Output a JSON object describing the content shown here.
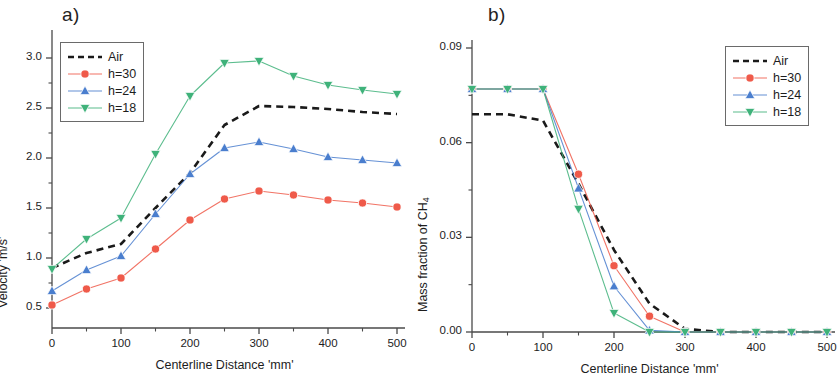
{
  "figure": {
    "panels": [
      {
        "id": "a",
        "label": "a)",
        "legend": {
          "position": "top-left",
          "entries": [
            {
              "name": "Air",
              "marker": "none",
              "color": "#1a1a1a",
              "dash": true
            },
            {
              "name": "h=30",
              "marker": "circle",
              "color": "#ef5a4a",
              "dash": false
            },
            {
              "name": "h=24",
              "marker": "triangle-up",
              "color": "#4a7ece",
              "dash": false
            },
            {
              "name": "h=18",
              "marker": "triangle-down",
              "color": "#3fb27a",
              "dash": false
            }
          ]
        },
        "chart_data": {
          "type": "line",
          "title": "",
          "xlabel": "Centerline Distance 'mm'",
          "ylabel": "Velocity 'm/s'",
          "xlim": [
            0,
            500
          ],
          "ylim": [
            0.3,
            3.2
          ],
          "xticks": [
            0,
            100,
            200,
            300,
            400,
            500
          ],
          "xtick_labels": [
            "0",
            "100",
            "200",
            "300",
            "400",
            "500"
          ],
          "yticks": [
            0.5,
            1.0,
            1.5,
            2.0,
            2.5,
            3.0
          ],
          "ytick_labels": [
            "0.5",
            "1.0",
            "1.5",
            "2.0",
            "2.5",
            "3.0"
          ],
          "minor_ticks": true,
          "grid": false,
          "legend_position": "top-left",
          "x": [
            0,
            50,
            100,
            150,
            200,
            250,
            300,
            350,
            400,
            450,
            500
          ],
          "series": [
            {
              "name": "Air",
              "color": "#1a1a1a",
              "style": "dashed",
              "marker": "none",
              "values": [
                0.9,
                1.05,
                1.14,
                1.5,
                1.85,
                2.33,
                2.52,
                2.51,
                2.49,
                2.46,
                2.44
              ]
            },
            {
              "name": "h=30",
              "color": "#ef5a4a",
              "style": "solid",
              "marker": "circle",
              "values": [
                0.53,
                0.69,
                0.8,
                1.09,
                1.38,
                1.59,
                1.67,
                1.63,
                1.58,
                1.55,
                1.51
              ]
            },
            {
              "name": "h=24",
              "color": "#4a7ece",
              "style": "solid",
              "marker": "triangle-up",
              "values": [
                0.67,
                0.88,
                1.02,
                1.44,
                1.84,
                2.1,
                2.16,
                2.09,
                2.01,
                1.98,
                1.95
              ]
            },
            {
              "name": "h=18",
              "color": "#3fb27a",
              "style": "solid",
              "marker": "triangle-down",
              "values": [
                0.89,
                1.19,
                1.4,
                2.04,
                2.62,
                2.95,
                2.97,
                2.82,
                2.73,
                2.68,
                2.64
              ]
            }
          ]
        }
      },
      {
        "id": "b",
        "label": "b)",
        "legend": {
          "position": "top-right",
          "entries": [
            {
              "name": "Air",
              "marker": "none",
              "color": "#1a1a1a",
              "dash": true
            },
            {
              "name": "h=30",
              "marker": "circle",
              "color": "#ef5a4a",
              "dash": false
            },
            {
              "name": "h=24",
              "marker": "triangle-up",
              "color": "#4a7ece",
              "dash": false
            },
            {
              "name": "h=18",
              "marker": "triangle-down",
              "color": "#3fb27a",
              "dash": false
            }
          ]
        },
        "chart_data": {
          "type": "line",
          "title": "",
          "xlabel": "Centerline Distance 'mm'",
          "ylabel": "Mass fraction of CH4",
          "ylabel_base": "Mass fraction of CH",
          "ylabel_sub": "4",
          "xlim": [
            0,
            500
          ],
          "ylim": [
            0.0,
            0.09
          ],
          "xticks": [
            0,
            100,
            200,
            300,
            400,
            500
          ],
          "xtick_labels": [
            "0",
            "100",
            "200",
            "300",
            "400",
            "500"
          ],
          "yticks": [
            0.0,
            0.03,
            0.06,
            0.09
          ],
          "ytick_labels": [
            "0.00",
            "0.03",
            "0.06",
            "0.09"
          ],
          "minor_ticks": true,
          "grid": false,
          "legend_position": "top-right",
          "x": [
            0,
            50,
            100,
            150,
            200,
            250,
            300,
            350,
            400,
            450,
            500
          ],
          "series": [
            {
              "name": "Air",
              "color": "#1a1a1a",
              "style": "dashed",
              "marker": "none",
              "values": [
                0.069,
                0.069,
                0.067,
                0.047,
                0.026,
                0.009,
                0.001,
                0.0,
                0.0,
                0.0,
                0.0
              ]
            },
            {
              "name": "h=30",
              "color": "#ef5a4a",
              "style": "solid",
              "marker": "circle",
              "values": [
                0.077,
                0.077,
                0.077,
                0.05,
                0.021,
                0.005,
                0.0,
                0.0,
                0.0,
                0.0,
                0.0
              ]
            },
            {
              "name": "h=24",
              "color": "#4a7ece",
              "style": "solid",
              "marker": "triangle-up",
              "values": [
                0.077,
                0.077,
                0.077,
                0.0455,
                0.0145,
                0.0005,
                0.0,
                0.0,
                0.0,
                0.0,
                0.0
              ]
            },
            {
              "name": "h=18",
              "color": "#3fb27a",
              "style": "solid",
              "marker": "triangle-down",
              "values": [
                0.077,
                0.077,
                0.077,
                0.039,
                0.006,
                0.0,
                0.0,
                0.0,
                0.0,
                0.0,
                0.0
              ]
            }
          ]
        }
      }
    ]
  }
}
